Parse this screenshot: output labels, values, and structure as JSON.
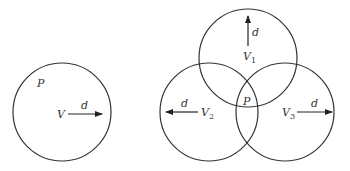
{
  "diagram": {
    "left": {
      "point_label": "P",
      "vertex_label": "V",
      "radius_label": "d"
    },
    "right": {
      "circles": [
        {
          "vertex": "V",
          "subscript": "1",
          "radius_label": "d",
          "arrow_direction": "up"
        },
        {
          "vertex": "V",
          "subscript": "2",
          "radius_label": "d",
          "arrow_direction": "left"
        },
        {
          "vertex": "V",
          "subscript": "3",
          "radius_label": "d",
          "arrow_direction": "right"
        }
      ],
      "intersection_label": "P"
    },
    "colors": {
      "stroke": "#333333",
      "background": "#ffffff"
    }
  }
}
